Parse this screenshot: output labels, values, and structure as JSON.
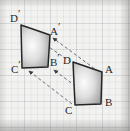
{
  "figure": {
    "background_color": "#f2f2f0",
    "grid": "faint-graph-paper",
    "stroke_color": "#262626",
    "dashed_color": "#6b6f75",
    "fill_light": "#fbfbfb",
    "fill_dark": "#9a9a9a"
  },
  "shapes": [
    {
      "name": "image-quadrilateral",
      "id": "prime",
      "vertices": [
        {
          "label": "D",
          "prime": "′",
          "x": 21,
          "y": 25
        },
        {
          "label": "A",
          "prime": "′",
          "x": 50,
          "y": 35
        },
        {
          "label": "B",
          "prime": "′",
          "x": 48,
          "y": 67
        },
        {
          "label": "C",
          "prime": "′",
          "x": 22,
          "y": 68
        }
      ]
    },
    {
      "name": "preimage-quadrilateral",
      "id": "plain",
      "vertices": [
        {
          "label": "D",
          "prime": "",
          "x": 73,
          "y": 62
        },
        {
          "label": "A",
          "prime": "",
          "x": 102,
          "y": 72
        },
        {
          "label": "B",
          "prime": "",
          "x": 101,
          "y": 104
        },
        {
          "label": "C",
          "prime": "",
          "x": 75,
          "y": 105
        }
      ]
    }
  ],
  "labels": [
    {
      "name": "label-d-prime",
      "text": "D",
      "prime": "′",
      "x": 10,
      "y": 13
    },
    {
      "name": "label-a-prime",
      "text": "A",
      "prime": "′",
      "x": 50,
      "y": 26
    },
    {
      "name": "label-b-prime",
      "text": "B",
      "prime": "′",
      "x": 50,
      "y": 57
    },
    {
      "name": "label-c-prime",
      "text": "C",
      "prime": "′",
      "x": 11,
      "y": 64
    },
    {
      "name": "label-d",
      "text": "D",
      "prime": "",
      "x": 63,
      "y": 55
    },
    {
      "name": "label-a",
      "text": "A",
      "prime": "",
      "x": 105,
      "y": 64
    },
    {
      "name": "label-b",
      "text": "B",
      "prime": "",
      "x": 105,
      "y": 97
    },
    {
      "name": "label-c",
      "text": "C",
      "prime": "",
      "x": 65,
      "y": 105
    }
  ],
  "translation_vectors": [
    {
      "name": "vector-d-to-d-prime",
      "from": "D",
      "to": "D′",
      "x1": 71,
      "y1": 62,
      "x2": 40,
      "y2": 41
    },
    {
      "name": "vector-a-to-a-prime",
      "from": "A",
      "to": "A′",
      "x1": 99,
      "y1": 72,
      "x2": 53,
      "y2": 38
    },
    {
      "name": "vector-b-to-b-prime",
      "from": "B",
      "to": "B′",
      "x1": 98,
      "y1": 103,
      "x2": 54,
      "y2": 70
    },
    {
      "name": "vector-c-to-c-prime",
      "from": "C",
      "to": "C′",
      "x1": 72,
      "y1": 104,
      "x2": 29,
      "y2": 71
    }
  ]
}
